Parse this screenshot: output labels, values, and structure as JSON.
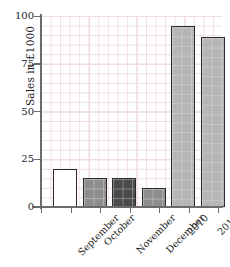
{
  "chart_data": {
    "type": "bar",
    "title": "",
    "subtitle": "",
    "xlabel": "",
    "ylabel": "Sales in £1000",
    "categories": [
      "September",
      "October",
      "November",
      "December",
      "2010",
      "2011"
    ],
    "values": [
      20,
      15,
      15,
      10,
      95,
      89
    ],
    "series": [
      {
        "name": "Sales",
        "values": [
          20,
          15,
          15,
          10,
          95,
          89
        ]
      }
    ],
    "ylim": [
      0,
      100
    ],
    "yticks": [
      0,
      25,
      50,
      75,
      100
    ],
    "ytick_labels": [
      "0",
      "25",
      "50",
      "75",
      "100"
    ],
    "xtick_labels": [
      "September",
      "October",
      "November",
      "December",
      "2010",
      "2011"
    ],
    "grid": true,
    "grid_color": "#f0d8d8",
    "legend": false,
    "legend_position": "none",
    "bar_colors": [
      "#ffffff",
      "#8e8e8e",
      "#4a4a4a",
      "#8e8e8e",
      "#b6b6b6",
      "#b6b6b6"
    ],
    "bar_edge_color": "#2a2a2a",
    "axis_color": "#6b6b6b",
    "background": "#ffffff",
    "annotations": []
  },
  "axis": {
    "y_title": "Sales in £1000",
    "y_tick_0": "0",
    "y_tick_25": "25",
    "y_tick_50": "50",
    "y_tick_75": "75",
    "y_tick_100": "100"
  },
  "x_labels": {
    "l0": "September",
    "l1": "October",
    "l2": "November",
    "l3": "December",
    "l4": "2010",
    "l5": "2011"
  }
}
